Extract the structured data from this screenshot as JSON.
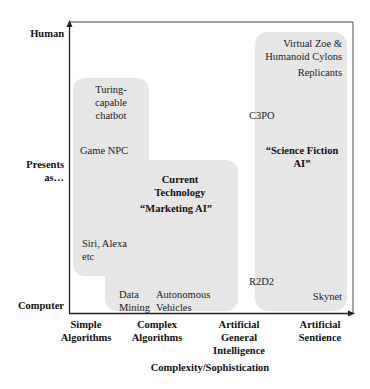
{
  "axes": {
    "y_labels": {
      "top": "Human",
      "middle_line1": "Presents",
      "middle_line2": "as…",
      "bottom": "Computer"
    },
    "x_labels": [
      {
        "line1": "Simple",
        "line2": "Algorithms",
        "line3": ""
      },
      {
        "line1": "Complex",
        "line2": "Algorithms",
        "line3": ""
      },
      {
        "line1": "Artificial",
        "line2": "General",
        "line3": "Intelligence"
      },
      {
        "line1": "Artificial",
        "line2": "Sentience",
        "line3": ""
      }
    ],
    "x_title": "Complexity/Sophistication"
  },
  "regions": {
    "current_tech": {
      "title_line1": "Current",
      "title_line2": "Technology",
      "subtitle": "“Marketing AI”",
      "items": {
        "turing_line1": "Turing-",
        "turing_line2": "capable",
        "turing_line3": "chatbot",
        "game_npc": "Game NPC",
        "siri_line1": "Siri, Alexa",
        "siri_line2": "etc",
        "data_line1": "Data",
        "data_line2": "Mining",
        "auto_line1": "Autonomous",
        "auto_line2": "Vehicles"
      }
    },
    "science_fiction": {
      "title_line1": "“Science Fiction",
      "title_line2": "AI”",
      "items": {
        "zoe_line1": "Virtual Zoe &",
        "zoe_line2": "Humanoid Cylons",
        "replicants": "Replicants",
        "c3po": "C3PO",
        "r2d2": "R2D2",
        "skynet": "Skynet"
      }
    }
  },
  "colors": {
    "region_fill": "#e6e6e6",
    "axis": "#222222",
    "frame": "#555555"
  }
}
